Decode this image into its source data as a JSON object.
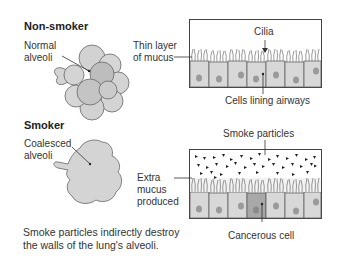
{
  "nonsmoker": {
    "heading": "Non-smoker",
    "alveoli_label_line1": "Normal",
    "alveoli_label_line2": "alveoli",
    "mucus_label_line1": "Thin layer",
    "mucus_label_line2": "of mucus",
    "cilia_label": "Cilia",
    "cells_label": "Cells lining airways"
  },
  "smoker": {
    "heading": "Smoker",
    "alveoli_label_line1": "Coalesced",
    "alveoli_label_line2": "alveoli",
    "mucus_label_line1": "Extra",
    "mucus_label_line2": "mucus",
    "mucus_label_line3": "produced",
    "particles_label": "Smoke particles",
    "cancer_label": "Cancerous cell"
  },
  "caption": {
    "line1": "Smoke particles indirectly destroy",
    "line2": "the walls of the lung's alveoli."
  },
  "colors": {
    "alveoli_fill": "#d4d4d4",
    "alveoli_dark": "#bdbdbd",
    "cell_fill": "#d8d8d8",
    "nucleus": "#9a9a9a",
    "cancer_cell": "#a8a8a8",
    "outline": "#555555"
  }
}
